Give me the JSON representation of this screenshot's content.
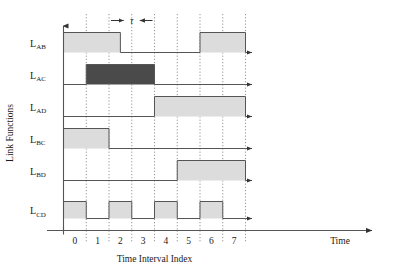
{
  "figure": {
    "ylabel": "Link Functions",
    "xlabel": "Time Interval Index",
    "x_axis_end_label": "Time",
    "tau_label": "τ"
  },
  "colors": {
    "fill_light": "#dcdcdc",
    "fill_dark": "#4a4a4a",
    "line": "#555555",
    "axis": "#555555",
    "grid": "#777777",
    "text": "#1a1a1a",
    "background": "#ffffff"
  },
  "chart_data": {
    "type": "line",
    "title": "",
    "xlabel": "Time Interval Index",
    "ylabel": "Link Functions",
    "x_axis_end_label": "Time",
    "grid": true,
    "legend": "none",
    "annotations": [
      {
        "name": "tau-span",
        "label": "τ",
        "from": 2.0,
        "to": 4.0,
        "center": 3.0,
        "style": "outward-arrows"
      }
    ],
    "x": [
      0,
      1,
      2,
      3,
      4,
      5,
      6,
      7
    ],
    "xlim": [
      0,
      8
    ],
    "tick_labels": [
      "0",
      "1",
      "2",
      "3",
      "4",
      "5",
      "6",
      "7"
    ],
    "series": [
      {
        "name": "L_AB",
        "label_main": "L",
        "label_sub": "AB",
        "fill": "light",
        "values": [
          1,
          1,
          1,
          0,
          0,
          0,
          1,
          1
        ],
        "transitions": [
          {
            "x": 0.0,
            "level": 1
          },
          {
            "x": 2.5,
            "level": 0
          },
          {
            "x": 6.0,
            "level": 1
          }
        ]
      },
      {
        "name": "L_AC",
        "label_main": "L",
        "label_sub": "AC",
        "fill": "dark",
        "values": [
          0,
          1,
          1,
          1,
          0,
          0,
          0,
          0
        ],
        "transitions": [
          {
            "x": 0.0,
            "level": 0
          },
          {
            "x": 1.0,
            "level": 1
          },
          {
            "x": 4.0,
            "level": 0
          }
        ]
      },
      {
        "name": "L_AD",
        "label_main": "L",
        "label_sub": "AD",
        "fill": "light",
        "values": [
          0,
          0,
          0,
          0,
          1,
          1,
          1,
          1
        ],
        "transitions": [
          {
            "x": 0.0,
            "level": 0
          },
          {
            "x": 4.0,
            "level": 1
          }
        ]
      },
      {
        "name": "L_BC",
        "label_main": "L",
        "label_sub": "BC",
        "fill": "light",
        "values": [
          1,
          1,
          0,
          0,
          0,
          0,
          0,
          0
        ],
        "transitions": [
          {
            "x": 0.0,
            "level": 1
          },
          {
            "x": 2.0,
            "level": 0
          }
        ]
      },
      {
        "name": "L_BD",
        "label_main": "L",
        "label_sub": "BD",
        "fill": "light",
        "values": [
          0,
          0,
          0,
          0,
          0,
          1,
          1,
          1
        ],
        "transitions": [
          {
            "x": 0.0,
            "level": 0
          },
          {
            "x": 5.0,
            "level": 1
          }
        ]
      },
      {
        "name": "L_CD",
        "label_main": "L",
        "label_sub": "CD",
        "fill": "light",
        "values": [
          1,
          0,
          1,
          0,
          1,
          0,
          1,
          0
        ],
        "transitions": [
          {
            "x": 0.0,
            "level": 1
          },
          {
            "x": 1.0,
            "level": 0
          },
          {
            "x": 2.0,
            "level": 1
          },
          {
            "x": 3.0,
            "level": 0
          },
          {
            "x": 4.0,
            "level": 1
          },
          {
            "x": 5.0,
            "level": 0
          },
          {
            "x": 6.0,
            "level": 1
          },
          {
            "x": 7.0,
            "level": 0
          }
        ]
      }
    ]
  }
}
